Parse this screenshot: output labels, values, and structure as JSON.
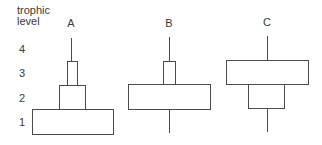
{
  "axis": {
    "title_line1": "trophic",
    "title_line2": "level",
    "levels": [
      "4",
      "3",
      "2",
      "1"
    ]
  },
  "pyramids": [
    {
      "label": "A",
      "description": "upright pyramid: level 1 widest, level 2 medium, level 3 narrow, level 4 line"
    },
    {
      "label": "B",
      "description": "level 3 narrow, level 2 wide, levels 1 and 4 lines"
    },
    {
      "label": "C",
      "description": "level 3 wide, level 2 medium, levels 1 and 4 lines"
    }
  ],
  "style": {
    "stroke": "#4a4a4a",
    "text": "#3a3a3a"
  }
}
